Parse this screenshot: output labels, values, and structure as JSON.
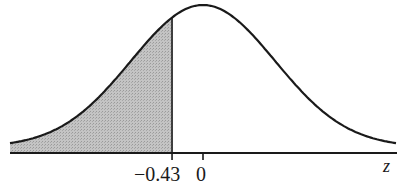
{
  "chart_data": {
    "type": "area",
    "title": "",
    "xlabel": "z",
    "ylabel": "",
    "tick_labels": [
      "-0.43",
      "0"
    ],
    "ticks": [
      -0.43,
      0
    ],
    "shaded_region": {
      "from": "-inf",
      "to": -0.43
    },
    "distribution": {
      "name": "standard normal",
      "mean": 0,
      "sd": 1
    },
    "xlim": [
      -2.68,
      2.68
    ],
    "grid": false,
    "legend": null
  },
  "labels": {
    "tick_neg": "−0.43",
    "tick_zero": "0",
    "axis": "z"
  },
  "colors": {
    "curve": "#1a1a1a",
    "shade": "#bdbdbd",
    "axis": "#1a1a1a"
  }
}
